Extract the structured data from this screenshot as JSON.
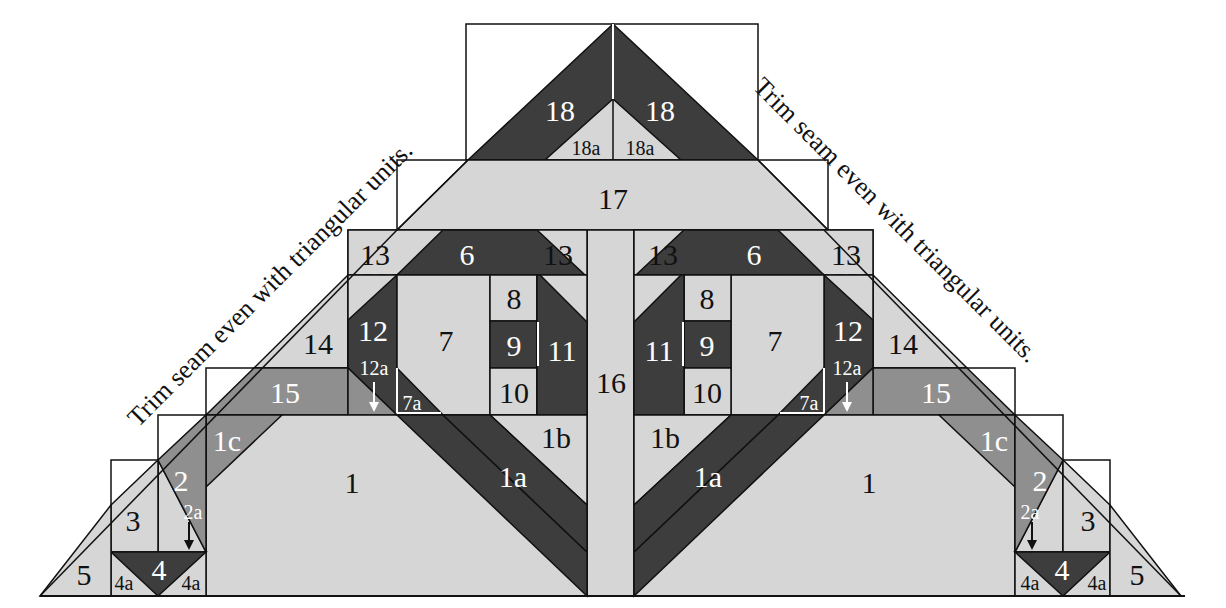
{
  "diagram": {
    "colors": {
      "light": "#d6d6d6",
      "medium": "#8f8f8f",
      "dark": "#3d3d3d",
      "line": "#111111"
    },
    "notes": {
      "left": "Trim seam even with triangular units.",
      "right": "Trim seam even with triangular units."
    },
    "labels": {
      "p18": "18",
      "p18a": "18a",
      "p17": "17",
      "p16": "16",
      "p13": "13",
      "p6": "6",
      "p7": "7",
      "p7a": "7a",
      "p8": "8",
      "p9": "9",
      "p10": "10",
      "p11": "11",
      "p12": "12",
      "p12a": "12a",
      "p14": "14",
      "p15": "15",
      "p1": "1",
      "p1a": "1a",
      "p1b": "1b",
      "p1c": "1c",
      "p2": "2",
      "p2a": "2a",
      "p3": "3",
      "p4": "4",
      "p4a": "4a",
      "p5": "5"
    }
  }
}
